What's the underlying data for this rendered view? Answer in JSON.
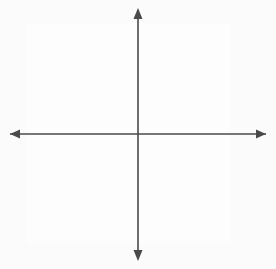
{
  "figure": {
    "type": "coordinate-plane-diagram",
    "colors": {
      "background": "#fbfbfb",
      "grid": "#9a9a9a",
      "axis": "#4a4a4a",
      "shape_stroke": "#111111",
      "label": "#111111"
    }
  },
  "plane": {
    "origin_label": "O",
    "x_axis_label": "x",
    "y_axis_label": "y",
    "grid_visible": true,
    "grid_spacing_units": 1,
    "x_range": [
      -7,
      6
    ],
    "y_range": [
      -7,
      7
    ],
    "origin_px": {
      "x": 138,
      "y": 134
    },
    "unit_px": 15.7
  },
  "shapes": [
    {
      "name": "triangle-RST",
      "closed": true,
      "vertices": [
        {
          "label": "R",
          "x": -2,
          "y": 3
        },
        {
          "label": "S",
          "x": 0,
          "y": -2
        },
        {
          "label": "T",
          "x": 3,
          "y": -1
        }
      ]
    },
    {
      "name": "triangle-R-prime-S-prime-T-prime",
      "closed": true,
      "vertices": [
        {
          "label": "R'",
          "x": -4,
          "y": 6
        },
        {
          "label": "S'",
          "x": 0,
          "y": -4
        },
        {
          "label": "T'",
          "x": 6,
          "y": -2
        }
      ]
    }
  ],
  "labels": {
    "R": {
      "text": "R",
      "x": -2,
      "y": 3,
      "dx": -9,
      "dy": -5
    },
    "S": {
      "text": "S",
      "x": 0,
      "y": -2,
      "dx": -3,
      "dy": 13
    },
    "T": {
      "text": "T",
      "x": 3,
      "y": -1,
      "dx": 5,
      "dy": 1
    },
    "Rp": {
      "text": "R'",
      "x": -4,
      "y": 6,
      "dx": -6,
      "dy": -5
    },
    "Sp": {
      "text": "S'",
      "x": 0,
      "y": -4,
      "dx": -3,
      "dy": 14
    },
    "Tp": {
      "text": "T'",
      "x": 6,
      "y": -2,
      "dx": 5,
      "dy": 2
    },
    "O": {
      "text": "O",
      "x": 0,
      "y": 0,
      "dx": -12,
      "dy": 14
    },
    "x": {
      "text": "x"
    },
    "y": {
      "text": "y"
    }
  }
}
